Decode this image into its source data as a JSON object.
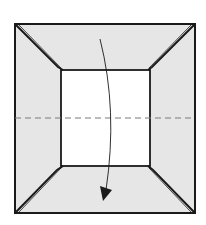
{
  "diagram": {
    "type": "origami-fold-step",
    "colors": {
      "paper_back": "#e6e6e6",
      "paper_front": "#ffffff",
      "line": "#1a1a1a",
      "valley_fold": "#7a7a7a"
    },
    "outer_square": {
      "x": 15,
      "y": 24,
      "w": 180,
      "h": 189
    },
    "inner_square": {
      "x": 61,
      "y": 70,
      "w": 89,
      "h": 96
    },
    "fold_line": {
      "type": "valley",
      "y": 118
    },
    "arrow": {
      "direction": "down",
      "from": [
        100,
        39
      ],
      "to": [
        104,
        198
      ]
    }
  }
}
